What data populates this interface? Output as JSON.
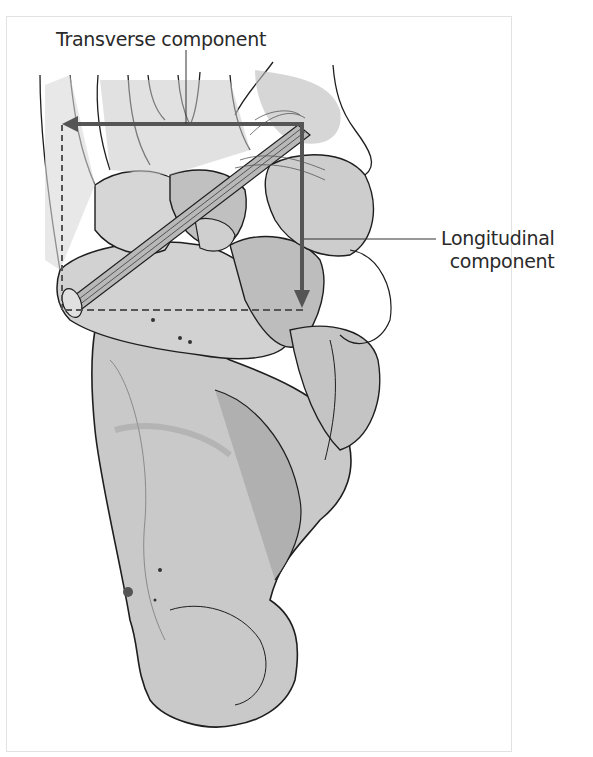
{
  "figure": {
    "labels": {
      "transverse": "Transverse component",
      "longitudinal_line1": "Longitudinal",
      "longitudinal_line2": "component"
    },
    "colors": {
      "arrow": "#555555",
      "bone_light": "#dcdcdc",
      "bone_mid": "#bdbdbd",
      "bone_dark": "#9e9e9e",
      "outline": "#1e1e1e",
      "text": "#2a2a2a",
      "border": "#e2e2e2"
    }
  }
}
